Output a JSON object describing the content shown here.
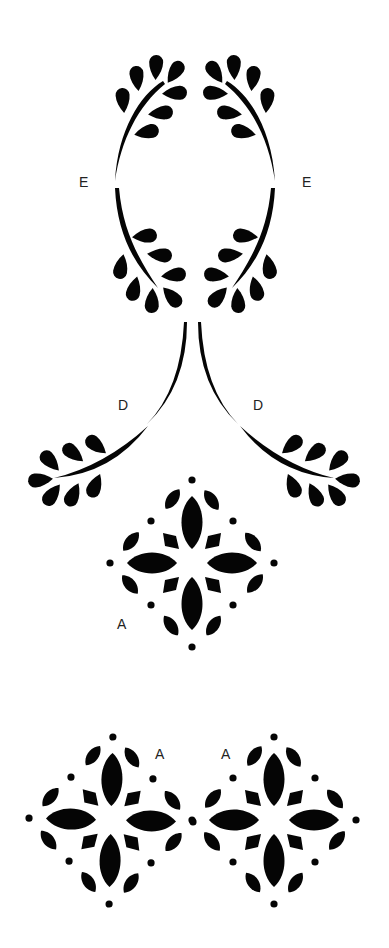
{
  "page": {
    "background": "#ffffff",
    "ink_color": "#050505",
    "label_color": "#222222"
  },
  "pieces": [
    {
      "label": "E",
      "type": "oval-leaf-wreath",
      "count": 2
    },
    {
      "label": "D",
      "type": "curved-leaf-sprig",
      "count": 2
    },
    {
      "label": "A",
      "type": "diamond-flower-motif",
      "count": 3
    }
  ],
  "labels": {
    "e_left": "E",
    "e_right": "E",
    "d_left": "D",
    "d_right": "D",
    "a_top": "A",
    "a_bottom_left": "A",
    "a_bottom_right": "A"
  }
}
